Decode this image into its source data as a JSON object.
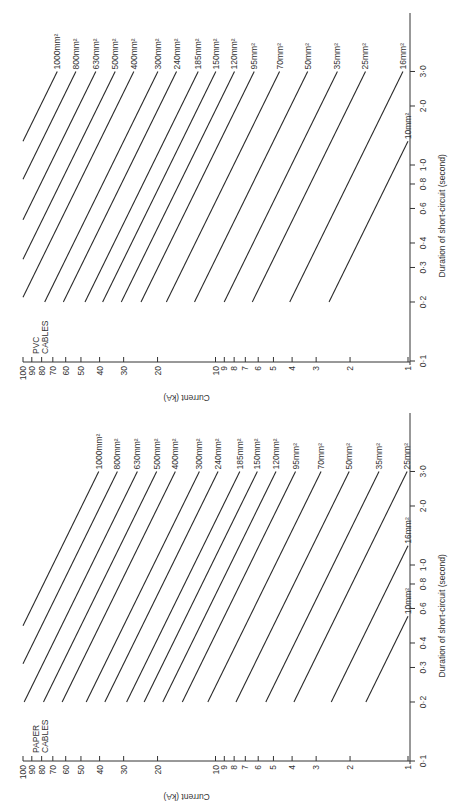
{
  "chart_data": [
    {
      "type": "line",
      "title_lines": [
        "PVC",
        "CABLES"
      ],
      "xlabel": "Duration of short-circuit    (second)",
      "ylabel": "Current (kA)",
      "x_scale": "log",
      "y_scale": "log",
      "xlim": [
        0.1,
        3.0
      ],
      "ylim": [
        1,
        100
      ],
      "x_ticks": [
        0.1,
        0.2,
        0.3,
        0.4,
        0.6,
        0.8,
        1.0,
        2.0,
        3.0
      ],
      "x_tick_labels": [
        "0·1",
        "0·2",
        "0·3",
        "0·4",
        "0·6",
        "0·8",
        "1·0",
        "2·0",
        "3·0"
      ],
      "y_ticks": [
        1,
        2,
        3,
        4,
        5,
        6,
        7,
        8,
        9,
        10,
        20,
        30,
        40,
        50,
        60,
        70,
        80,
        90,
        100
      ],
      "y_tick_labels": [
        "1",
        "2",
        "3",
        "4",
        "5",
        "6",
        "7",
        "8",
        "9",
        "10",
        "20",
        "30",
        "40",
        "50",
        "60",
        "70",
        "80",
        "90",
        "100"
      ],
      "line_duration_range": [
        0.2,
        3.0
      ],
      "series": [
        {
          "name": "1000mm²",
          "current_kA_at_1s": 115
        },
        {
          "name": "800mm²",
          "current_kA_at_1s": 92
        },
        {
          "name": "630mm²",
          "current_kA_at_1s": 72.5
        },
        {
          "name": "500mm²",
          "current_kA_at_1s": 57.5
        },
        {
          "name": "400mm²",
          "current_kA_at_1s": 46
        },
        {
          "name": "300mm²",
          "current_kA_at_1s": 34.5
        },
        {
          "name": "240mm²",
          "current_kA_at_1s": 27.6
        },
        {
          "name": "185mm²",
          "current_kA_at_1s": 21.3
        },
        {
          "name": "150mm²",
          "current_kA_at_1s": 17.25
        },
        {
          "name": "120mm²",
          "current_kA_at_1s": 13.8
        },
        {
          "name": "95mm²",
          "current_kA_at_1s": 10.9
        },
        {
          "name": "70mm²",
          "current_kA_at_1s": 8.05
        },
        {
          "name": "50mm²",
          "current_kA_at_1s": 5.75
        },
        {
          "name": "35mm²",
          "current_kA_at_1s": 4.03
        },
        {
          "name": "25mm²",
          "current_kA_at_1s": 2.88
        },
        {
          "name": "16mm²",
          "current_kA_at_1s": 1.84
        },
        {
          "name": "10mm²",
          "current_kA_at_1s": 1.15
        }
      ],
      "relationship": "I = I_1s / sqrt(t)"
    },
    {
      "type": "line",
      "title_lines": [
        "PAPER",
        "CABLES"
      ],
      "xlabel": "Duration of short-circuit    (second)",
      "ylabel": "Current (kA)",
      "x_scale": "log",
      "y_scale": "log",
      "xlim": [
        0.1,
        3.0
      ],
      "ylim": [
        1,
        100
      ],
      "x_ticks": [
        0.1,
        0.2,
        0.3,
        0.4,
        0.6,
        0.8,
        1.0,
        2.0,
        3.0
      ],
      "x_tick_labels": [
        "0·1",
        "0·2",
        "0·3",
        "0·4",
        "0·6",
        "0·8",
        "1·0",
        "2·0",
        "3·0"
      ],
      "y_ticks": [
        1,
        2,
        3,
        4,
        5,
        6,
        7,
        8,
        9,
        10,
        20,
        30,
        40,
        50,
        60,
        70,
        80,
        90,
        100
      ],
      "y_tick_labels": [
        "1",
        "2",
        "3",
        "4",
        "5",
        "6",
        "7",
        "8",
        "9",
        "10",
        "20",
        "30",
        "40",
        "50",
        "60",
        "70",
        "80",
        "90",
        "100"
      ],
      "line_duration_range": [
        0.2,
        3.0
      ],
      "series": [
        {
          "name": "1000mm²",
          "current_kA_at_1s": 70
        },
        {
          "name": "800mm²",
          "current_kA_at_1s": 56
        },
        {
          "name": "630mm²",
          "current_kA_at_1s": 44.1
        },
        {
          "name": "500mm²",
          "current_kA_at_1s": 35
        },
        {
          "name": "400mm²",
          "current_kA_at_1s": 28
        },
        {
          "name": "300mm²",
          "current_kA_at_1s": 21
        },
        {
          "name": "240mm²",
          "current_kA_at_1s": 16.8
        },
        {
          "name": "185mm²",
          "current_kA_at_1s": 12.95
        },
        {
          "name": "150mm²",
          "current_kA_at_1s": 10.5
        },
        {
          "name": "120mm²",
          "current_kA_at_1s": 8.4
        },
        {
          "name": "95mm²",
          "current_kA_at_1s": 6.65
        },
        {
          "name": "70mm²",
          "current_kA_at_1s": 4.9
        },
        {
          "name": "50mm²",
          "current_kA_at_1s": 3.5
        },
        {
          "name": "35mm²",
          "current_kA_at_1s": 2.45
        },
        {
          "name": "25mm²",
          "current_kA_at_1s": 1.75
        },
        {
          "name": "16mm²",
          "current_kA_at_1s": 1.12
        },
        {
          "name": "10mm²",
          "current_kA_at_1s": 0.74
        }
      ],
      "relationship": "I = I_1s / sqrt(t)"
    }
  ]
}
